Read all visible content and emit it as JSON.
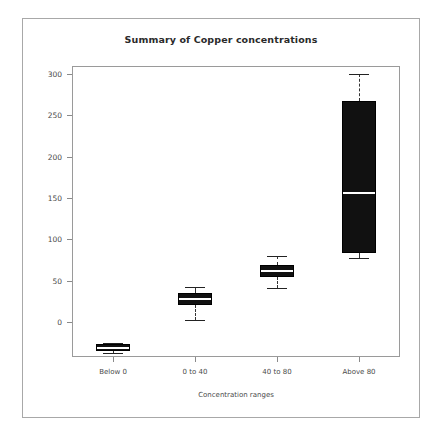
{
  "chart_data": {
    "type": "box",
    "title": "Summary of Copper concentrations",
    "xlabel": "Concentration ranges",
    "ylabel": "",
    "categories": [
      "Below 0",
      "0 to 40",
      "40 to 80",
      "Above 80"
    ],
    "yticks": [
      300,
      250,
      200,
      150,
      100,
      50,
      0
    ],
    "ylim": [
      -45,
      315
    ],
    "grid": false,
    "legend": null,
    "boxes": [
      {
        "category": "Below 0",
        "whisker_high": -25,
        "q3": -27,
        "median": -31,
        "q1": -35,
        "whisker_low": -38
      },
      {
        "category": "0 to 40",
        "whisker_high": 42,
        "q3": 35,
        "median": 28,
        "q1": 20,
        "whisker_low": 2
      },
      {
        "category": "40 to 80",
        "whisker_high": 80,
        "q3": 69,
        "median": 62,
        "q1": 55,
        "whisker_low": 41
      },
      {
        "category": "Above 80",
        "whisker_high": 300,
        "q3": 267,
        "median": 157,
        "q1": 83,
        "whisker_low": 77
      }
    ]
  },
  "chart": {
    "title": "Summary of Copper concentrations",
    "xlabel": "Concentration ranges"
  },
  "colors": {
    "box_fill": "#111111",
    "frame": "#9a9a9a",
    "page_frame": "#a8a8a8",
    "text": "#4a4a4a",
    "title": "#2a2a2a"
  }
}
